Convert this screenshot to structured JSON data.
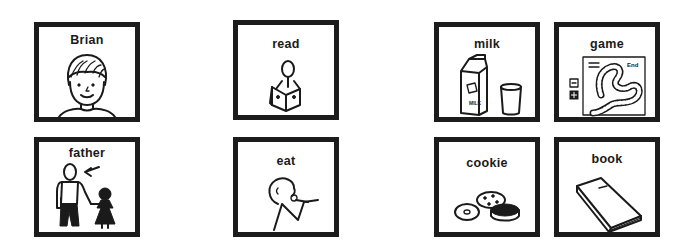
{
  "board": {
    "cards": [
      {
        "id": "brian",
        "label": "Brian",
        "icon": "boy-face-icon"
      },
      {
        "id": "father",
        "label": "father",
        "icon": "father-and-child-icon"
      },
      {
        "id": "read",
        "label": "read",
        "icon": "person-reading-icon"
      },
      {
        "id": "eat",
        "label": "eat",
        "icon": "person-eating-icon"
      },
      {
        "id": "milk",
        "label": "milk",
        "icon": "milk-carton-and-glass-icon"
      },
      {
        "id": "game",
        "label": "game",
        "icon": "board-game-icon"
      },
      {
        "id": "cookie",
        "label": "cookie",
        "icon": "cookies-icon"
      },
      {
        "id": "book",
        "label": "book",
        "icon": "book-icon"
      }
    ],
    "game_icon_text": "End",
    "milk_carton_text": "MILK",
    "colors": {
      "border": "#1c1c1c",
      "background": "#ffffff",
      "ink": "#1a1a1a"
    }
  }
}
